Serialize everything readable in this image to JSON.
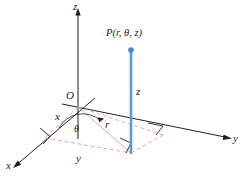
{
  "figure": {
    "type": "cylindrical-coordinates-diagram",
    "background_color": "#ffffff",
    "axis_color": "#231f20",
    "projection_color": "#e8a0a8",
    "height_segment_color": "#5b9bd5",
    "point_marker_color": "#4a86c8"
  },
  "labels": {
    "z_axis": "z",
    "x_axis": "x",
    "y_axis": "y",
    "origin": "O",
    "point": "P(r, θ, z)",
    "radius": "r",
    "theta": "θ",
    "height": "z",
    "x_leg": "x",
    "y_leg": "y"
  },
  "geometry": {
    "origin": [
      78,
      107
    ],
    "z_axis_tip": [
      78,
      10
    ],
    "x_axis_tip": [
      14,
      166
    ],
    "y_axis_tip": [
      231,
      138
    ],
    "point_P": [
      131,
      50
    ],
    "foot_of_P": [
      131,
      153
    ],
    "x_foot": [
      45,
      138
    ],
    "y_foot": [
      163,
      135
    ]
  }
}
